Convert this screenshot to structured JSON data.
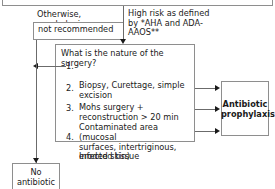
{
  "diagram": {
    "type": "flowchart",
    "background_color": "#ffffff",
    "line_color": "#6b6b6b",
    "border_color": "#8e8e8e",
    "text_color": "#1a1a1a"
  },
  "branches": {
    "left_label": "Otherwise, prophylaxis",
    "left_box_label": "not recommended",
    "right_label": "High risk as defined\nby *AHA and ADA-\nAAOS**"
  },
  "main": {
    "question": "What is the nature of the surgery?",
    "options": [
      {
        "num": "1.",
        "text": "Biopsy, Curettage, simple\nexcision"
      },
      {
        "num": "2.",
        "text": "Mohs surgery +\nreconstruction > 20 min"
      },
      {
        "num": "3.",
        "text": "Contaminated area (mucosal\nsurfaces, intertriginous,\neroded skin)"
      },
      {
        "num": "4.",
        "text": "Infected tissue"
      }
    ]
  },
  "outcomes": {
    "antibiotic_prophylaxis": "Antibiotic\nprophylaxis",
    "no_antibiotic": "No\nantibiotic"
  }
}
